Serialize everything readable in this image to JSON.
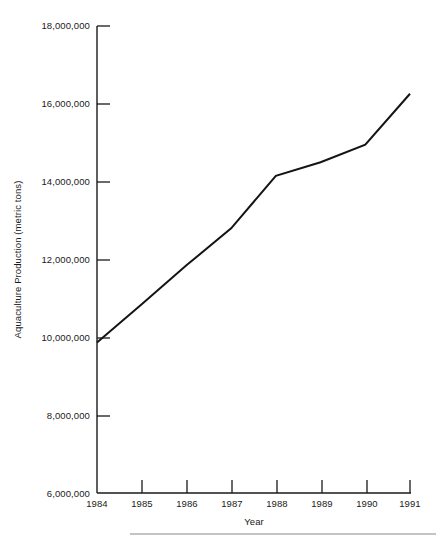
{
  "chart_data": {
    "type": "line",
    "title": "",
    "xlabel": "Year",
    "ylabel": "Aquaculture Production (metric tons)",
    "x": [
      1984,
      1985,
      1986,
      1987,
      1988,
      1989,
      1990,
      1991
    ],
    "categories": [
      "1984",
      "1985",
      "1986",
      "1987",
      "1988",
      "1989",
      "1990",
      "1991"
    ],
    "values": [
      9870000,
      10850000,
      11850000,
      12800000,
      14150000,
      14500000,
      14950000,
      16260000
    ],
    "series": [
      {
        "name": "Aquaculture Production",
        "values": [
          9870000,
          10850000,
          11850000,
          12800000,
          14150000,
          14500000,
          14950000,
          16260000
        ]
      }
    ],
    "xlim": [
      1984,
      1991
    ],
    "ylim": [
      6000000,
      18000000
    ],
    "ytick_values": [
      6000000,
      8000000,
      10000000,
      12000000,
      14000000,
      16000000,
      18000000
    ],
    "ytick_labels": [
      "6,000,000",
      "8,000,000",
      "10,000,000",
      "12,000,000",
      "14,000,000",
      "16,000,000",
      "18,000,000"
    ],
    "xtick_labels": [
      "1984",
      "1985",
      "1986",
      "1987",
      "1988",
      "1989",
      "1990",
      "1991"
    ],
    "grid": false,
    "legend": false,
    "legend_position": "none",
    "line_color": "#141414",
    "axis_color": "#1a1a1a",
    "background_color": "#ffffff"
  },
  "axes": {
    "y_title": "Aquaculture Production (metric tons)",
    "x_title": "Year"
  }
}
